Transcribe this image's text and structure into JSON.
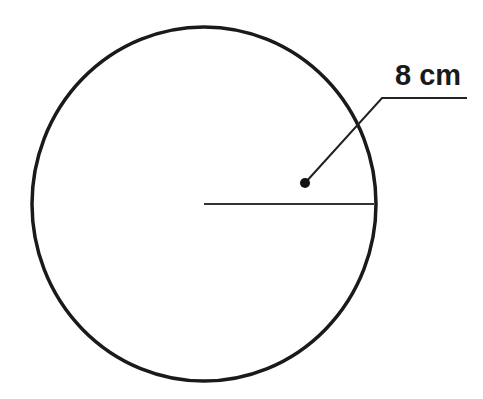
{
  "diagram": {
    "type": "circle-radius",
    "circle": {
      "cx": 204,
      "cy": 204,
      "rx": 172,
      "ry": 177,
      "stroke": "#1a1a1a",
      "stroke_width": 3.5
    },
    "radius_line": {
      "x1": 204,
      "y1": 204,
      "x2": 374,
      "y2": 204,
      "stroke": "#333333"
    },
    "callout": {
      "dot": {
        "cx": 305,
        "cy": 183,
        "r": 5
      },
      "leader_points": "305,183 382,98 467,98",
      "label": "8 cm",
      "label_x": 395,
      "label_y": 85
    }
  }
}
